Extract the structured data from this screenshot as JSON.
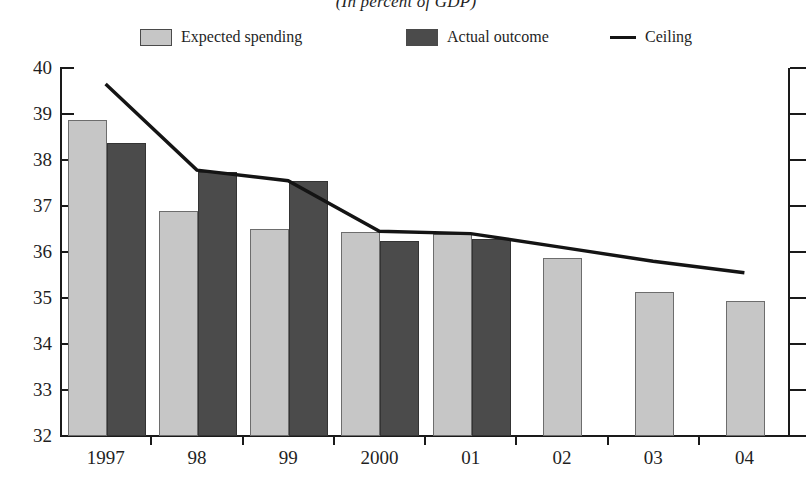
{
  "title": "(In percent of GDP)",
  "legend": {
    "expected": {
      "label": "Expected spending",
      "color": "#c6c6c6"
    },
    "actual": {
      "label": "Actual outcome",
      "color": "#4b4b4b"
    },
    "ceiling": {
      "label": "Ceiling",
      "color": "#141414"
    }
  },
  "axis": {
    "y_labels": [
      "40",
      "39",
      "38",
      "37",
      "36",
      "35",
      "34",
      "33",
      "32"
    ],
    "x_labels": [
      "1997",
      "98",
      "99",
      "2000",
      "01",
      "02",
      "03",
      "04"
    ]
  },
  "chart_data": {
    "type": "bar",
    "title": "(In percent of GDP)",
    "xlabel": "",
    "ylabel": "",
    "ylim": [
      32,
      40
    ],
    "yticks": [
      32,
      33,
      34,
      35,
      36,
      37,
      38,
      39,
      40
    ],
    "grid": false,
    "legend_position": "top",
    "categories": [
      "1997",
      "98",
      "99",
      "2000",
      "01",
      "02",
      "03",
      "04"
    ],
    "series": [
      {
        "name": "Expected spending",
        "type": "bar",
        "color": "#c6c6c6",
        "values": [
          38.82,
          36.85,
          36.45,
          36.4,
          36.35,
          35.83,
          35.08,
          34.9
        ]
      },
      {
        "name": "Actual outcome",
        "type": "bar",
        "color": "#4b4b4b",
        "values": [
          38.33,
          37.7,
          37.5,
          36.2,
          36.25,
          null,
          null,
          null
        ]
      },
      {
        "name": "Ceiling",
        "type": "line",
        "color": "#141414",
        "values": [
          39.65,
          37.78,
          37.55,
          36.45,
          36.4,
          36.1,
          35.8,
          35.55
        ]
      }
    ]
  }
}
